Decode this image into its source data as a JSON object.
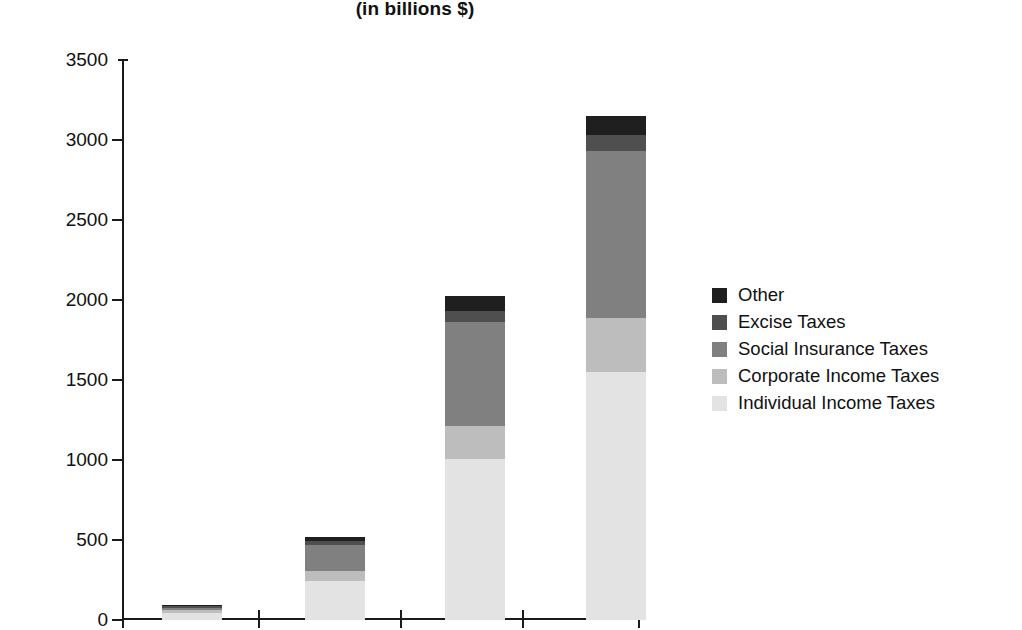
{
  "chart_data": {
    "type": "bar",
    "subtype": "stacked-bar",
    "title": "(in billions $)",
    "xlabel": "",
    "ylabel": "",
    "ylim": [
      0,
      3500
    ],
    "ytick_values": [
      0,
      500,
      1000,
      1500,
      2000,
      2500,
      3000,
      3500
    ],
    "ytick_labels": [
      "0",
      "500",
      "1000",
      "1500",
      "2000",
      "2500",
      "3000",
      "3500"
    ],
    "grid": false,
    "legend_position": "right",
    "categories": [
      "",
      "",
      "",
      ""
    ],
    "xtick_labels": [
      "",
      "",
      "",
      "",
      ""
    ],
    "series": [
      {
        "name": "Individual Income Taxes",
        "color": "#e3e3e3",
        "values": [
          41,
          244,
          1004,
          1550
        ]
      },
      {
        "name": "Corporate Income Taxes",
        "color": "#bdbdbd",
        "values": [
          21,
          65,
          207,
          340
        ]
      },
      {
        "name": "Social Insurance Taxes",
        "color": "#808080",
        "values": [
          15,
          158,
          653,
          1040
        ]
      },
      {
        "name": "Excise Taxes",
        "color": "#4f4f4f",
        "values": [
          12,
          24,
          69,
          100
        ]
      },
      {
        "name": "Other",
        "color": "#1f1f1f",
        "values": [
          1,
          26,
          92,
          120
        ]
      }
    ],
    "totals": [
      90,
      517,
      2025,
      3150
    ],
    "legend_order_top_to_bottom": [
      "Other",
      "Excise Taxes",
      "Social Insurance Taxes",
      "Corporate Income Taxes",
      "Individual Income Taxes"
    ]
  },
  "legend": {
    "items": [
      {
        "label": "Other",
        "color": "#1f1f1f"
      },
      {
        "label": "Excise Taxes",
        "color": "#4f4f4f"
      },
      {
        "label": "Social Insurance Taxes",
        "color": "#808080"
      },
      {
        "label": "Corporate Income Taxes",
        "color": "#bdbdbd"
      },
      {
        "label": "Individual Income Taxes",
        "color": "#e3e3e3"
      }
    ]
  },
  "axis": {
    "y_labels": [
      "3500",
      "3000",
      "2500",
      "2000",
      "1500",
      "1000",
      "500",
      "0"
    ]
  }
}
